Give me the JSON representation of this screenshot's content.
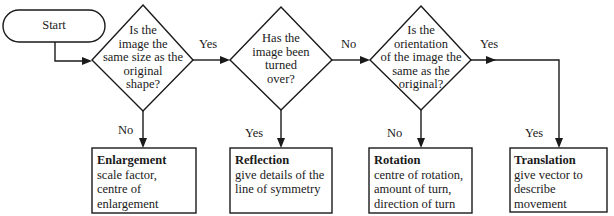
{
  "flowchart": {
    "start": {
      "label": "Start"
    },
    "decisions": [
      {
        "id": "d1",
        "lines": [
          "Is the",
          "image the",
          "same size as the",
          "original",
          "shape?"
        ]
      },
      {
        "id": "d2",
        "lines": [
          "Has the",
          "image been",
          "turned",
          "over?"
        ]
      },
      {
        "id": "d3",
        "lines": [
          "Is the",
          "orientation",
          "of the image the",
          "same as the",
          "original?"
        ]
      }
    ],
    "edge_labels": {
      "d1_right": "Yes",
      "d1_down": "No",
      "d2_right": "No",
      "d2_down": "Yes",
      "d3_right": "Yes",
      "d3_down": "No",
      "translation_down": "Yes"
    },
    "outcomes": [
      {
        "title": "Enlargement",
        "lines": [
          "scale factor,",
          "centre of",
          "enlargement"
        ]
      },
      {
        "title": "Reflection",
        "lines": [
          "give details of the",
          "line of symmetry"
        ]
      },
      {
        "title": "Rotation",
        "lines": [
          "centre of rotation,",
          "amount of turn,",
          "direction of turn"
        ]
      },
      {
        "title": "Translation",
        "lines": [
          "give vector to",
          "describe movement"
        ]
      }
    ],
    "colors": {
      "stroke": "#1a1a1a",
      "background": "#ffffff"
    }
  }
}
